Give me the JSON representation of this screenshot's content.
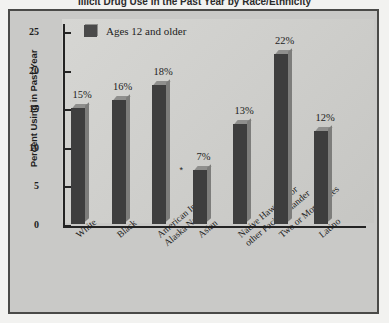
{
  "figure": {
    "cropped_title": "Illicit Drug Use in the Past Year by Race/Ethnicity",
    "legend_label": "Ages 12 and older",
    "footnote_marker": "*"
  },
  "chart_data": {
    "type": "bar",
    "title": "",
    "xlabel": "",
    "ylabel": "Percent Using in Past Year",
    "ylim": [
      0,
      25
    ],
    "yticks": [
      0,
      5,
      10,
      15,
      20,
      25
    ],
    "ytick_labels": [
      "0",
      "5",
      "10",
      "15",
      "20",
      "25"
    ],
    "grid": false,
    "legend_position": "top-left",
    "legend_entries": [
      "Ages 12 and older"
    ],
    "categories": [
      "White",
      "Black",
      "American Indian/\nAlaska Native",
      "Asian",
      "Native Hawaiian or\nother Pacific Islander",
      "Two or More Races",
      "Latino"
    ],
    "values": [
      15,
      16,
      18,
      7,
      13,
      22,
      12
    ],
    "data_labels": [
      "15%",
      "16%",
      "18%",
      "7%",
      "13%",
      "22%",
      "12%"
    ],
    "annotations": [
      {
        "category": "Asian",
        "marker": "*"
      }
    ],
    "series": [
      {
        "name": "Ages 12 and older",
        "values": [
          15,
          16,
          18,
          7,
          13,
          22,
          12
        ]
      }
    ]
  },
  "colors": {
    "bar_fill": "#3e3e3e",
    "bar_top_face": "#8f8f8d",
    "bar_side_face": "#7d7d7b",
    "panel_background": "#c9c9c7",
    "plot_background": "#d2d2cf",
    "frame_border": "#4a4a48",
    "axis": "#232323",
    "text": "#1d1d1d"
  }
}
